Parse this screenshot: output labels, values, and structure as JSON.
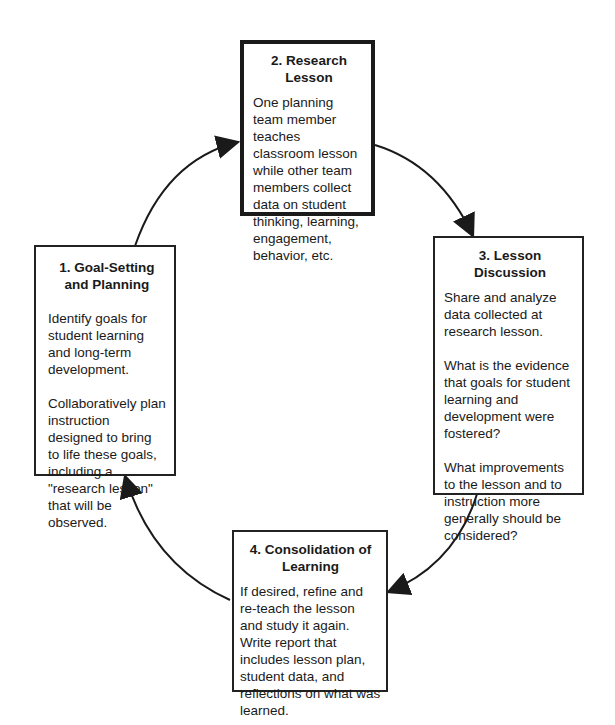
{
  "diagram": {
    "type": "cycle",
    "stages": [
      {
        "id": "goal-setting",
        "title": "1. Goal-Setting and Planning",
        "title_lines": [
          "1. Goal-Setting",
          "and Planning"
        ],
        "paragraphs": [
          "Identify goals for student learning and long-term development.",
          "Collaboratively plan instruction designed to bring to life these goals, including a \"research lesson\" that will be observed."
        ]
      },
      {
        "id": "research-lesson",
        "title": "2. Research Lesson",
        "paragraphs": [
          "One planning team member teaches classroom lesson while other team members collect data on student thinking, learning, engagement, behavior, etc."
        ]
      },
      {
        "id": "lesson-discussion",
        "title": "3. Lesson Discussion",
        "paragraphs": [
          "Share and analyze data collected at research lesson.",
          "What is the evidence that goals for student learning and development were fostered?",
          "What improvements to the lesson and to instruction more generally should be considered?"
        ]
      },
      {
        "id": "consolidation",
        "title": "4. Consolidation of Learning",
        "title_lines": [
          "4. Consolidation of",
          "Learning"
        ],
        "paragraphs": [
          "If desired, refine and re-teach the lesson and study it again. Write report that includes lesson plan, student data, and reflections on what was learned."
        ]
      }
    ],
    "arrows": [
      {
        "from": "goal-setting",
        "to": "research-lesson"
      },
      {
        "from": "research-lesson",
        "to": "lesson-discussion"
      },
      {
        "from": "lesson-discussion",
        "to": "consolidation"
      },
      {
        "from": "consolidation",
        "to": "goal-setting"
      }
    ]
  }
}
